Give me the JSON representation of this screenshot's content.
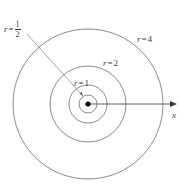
{
  "figure": {
    "type": "geometric-diagram",
    "background_color": "#ffffff",
    "stroke_color": "#5a5a5a",
    "text_color": "#3a3a3a",
    "center": {
      "x": 88,
      "y": 104,
      "marker": "filled-dot"
    },
    "circles": [
      {
        "name": "circle-r-half",
        "r_value": "1/2",
        "pixel_radius": 9
      },
      {
        "name": "circle-r-1",
        "r_value": "1",
        "pixel_radius": 19
      },
      {
        "name": "circle-r-2",
        "r_value": "2",
        "pixel_radius": 38
      },
      {
        "name": "circle-r-4",
        "r_value": "4",
        "pixel_radius": 75
      }
    ],
    "axis": {
      "name": "x-axis",
      "label": "x",
      "from_x": 88,
      "to_x": 174,
      "y": 104,
      "arrowhead": "right"
    },
    "leader_line": {
      "name": "leader-line-r-half",
      "from": {
        "x": 27,
        "y": 34
      },
      "to": {
        "x": 83,
        "y": 96
      }
    },
    "labels": {
      "r_half": {
        "var": "r",
        "eq": "=",
        "numerator": "1",
        "denominator": "2"
      },
      "r_1": {
        "var": "r",
        "eq": "=",
        "value": "1"
      },
      "r_2": {
        "var": "r",
        "eq": "=",
        "value": "2"
      },
      "r_4": {
        "var": "r",
        "eq": "=",
        "value": "4"
      },
      "x_axis": "x"
    }
  }
}
